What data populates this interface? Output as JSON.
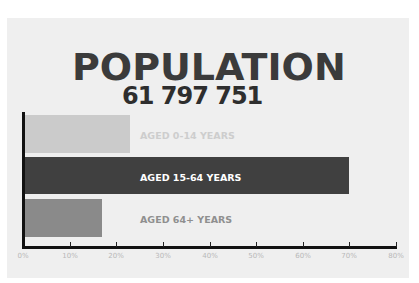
{
  "chart_data": {
    "type": "bar",
    "orientation": "horizontal",
    "title": "POPULATION",
    "subtitle": "61 797 751",
    "categories": [
      "AGED 0-14 YEARS",
      "AGED 15-64 YEARS",
      "AGED 64+ YEARS"
    ],
    "values": [
      23,
      70,
      17
    ],
    "unit": "%",
    "xlabel": "",
    "ylabel": "",
    "xlim": [
      0,
      80
    ],
    "x_ticks": [
      "0%",
      "10%",
      "20%",
      "30%",
      "40%",
      "50%",
      "60%",
      "70%",
      "80%"
    ],
    "grid": false,
    "legend": null,
    "bar_colors": [
      "#cbcbcb",
      "#404040",
      "#8a8a8a"
    ],
    "label_colors": [
      "#cdcdcd",
      "#ffffff",
      "#8f8f8f"
    ]
  },
  "colors": {
    "background": "#ffffff",
    "panel": "#efefef",
    "title": "#3b3b3b",
    "axis": "#111111",
    "tick_label": "#b8b8b8"
  }
}
